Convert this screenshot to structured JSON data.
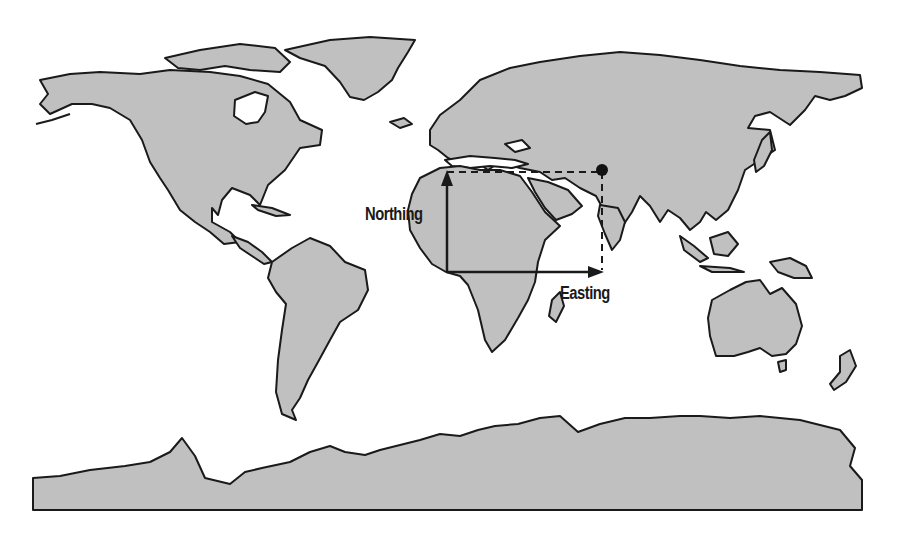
{
  "figure": {
    "land_color": "#c0c0c0",
    "coast_color": "#1a1a1a",
    "background_color": "#ffffff"
  },
  "annotations": {
    "northing_label": "Northing",
    "easting_label": "Easting",
    "northing_arrow": {
      "x1": 447,
      "y1": 272,
      "x2": 447,
      "y2": 172
    },
    "easting_arrow": {
      "x1": 447,
      "y1": 272,
      "x2": 602,
      "y2": 272
    },
    "point": {
      "x": 602,
      "y": 170,
      "label": "target-point"
    },
    "origin": {
      "x": 447,
      "y": 272
    }
  },
  "clipped_text": {
    "top": "",
    "bottom": ""
  }
}
